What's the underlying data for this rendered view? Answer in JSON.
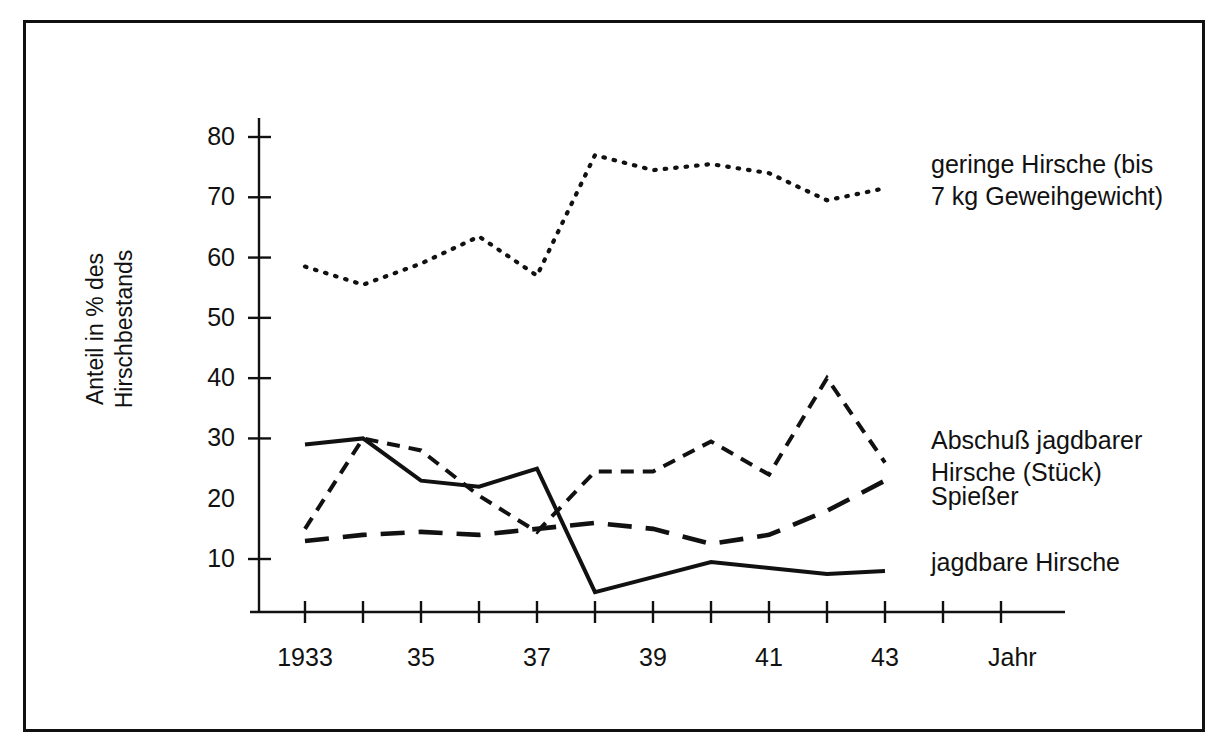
{
  "figure": {
    "background": "#ffffff",
    "ink_color": "#111111",
    "border_color": "#111111"
  },
  "axes": {
    "ylabel": "Anteil in % des\nHirschbestands",
    "xlabel": "Jahr",
    "ytick_labels": [
      "80",
      "70",
      "60",
      "50",
      "40",
      "30",
      "20",
      "10"
    ],
    "xtick_labels": [
      "1933",
      "35",
      "37",
      "39",
      "41",
      "43"
    ]
  },
  "legend": {
    "items": [
      {
        "name": "geringe-hirsche",
        "label": "geringe Hirsche (bis\n7 kg Geweihgewicht)",
        "style": "dotted"
      },
      {
        "name": "abschuss-jagdbarer-hirsche",
        "label": "Abschuß jagdbarer\nHirsche (Stück)",
        "style": "dashed-short"
      },
      {
        "name": "spiesser",
        "label": "Spießer",
        "style": "dashed-long"
      },
      {
        "name": "jagdbare-hirsche",
        "label": "jagdbare Hirsche",
        "style": "solid"
      }
    ]
  },
  "chart_data": {
    "type": "line",
    "title": "",
    "xlabel": "Jahr",
    "ylabel": "Anteil in % des Hirschbestands",
    "x": [
      1933,
      1934,
      1935,
      1936,
      1937,
      1938,
      1939,
      1940,
      1941,
      1942,
      1943
    ],
    "xtick_values": [
      1933,
      1934,
      1935,
      1936,
      1937,
      1938,
      1939,
      1940,
      1941,
      1942,
      1943,
      1944,
      1945
    ],
    "xtick_labeled": [
      1933,
      1935,
      1937,
      1939,
      1941,
      1943
    ],
    "ylim": [
      3,
      84
    ],
    "yticks": [
      10,
      20,
      30,
      40,
      50,
      60,
      70,
      80
    ],
    "grid": false,
    "legend_position": "right",
    "series": [
      {
        "name": "geringe Hirsche (bis 7 kg Geweihgewicht)",
        "style": "dotted",
        "values": [
          58.5,
          55.5,
          59.0,
          63.5,
          57.0,
          77.0,
          74.5,
          75.5,
          74.0,
          69.5,
          71.5
        ]
      },
      {
        "name": "Abschuß jagdbarer Hirsche (Stück)",
        "style": "dashed-short",
        "values": [
          15.0,
          30.0,
          28.0,
          20.5,
          14.5,
          24.5,
          24.5,
          29.5,
          24.0,
          40.0,
          26.0
        ]
      },
      {
        "name": "Spießer",
        "style": "dashed-long",
        "values": [
          13.0,
          14.0,
          14.5,
          14.0,
          15.0,
          16.0,
          15.0,
          12.5,
          14.0,
          18.0,
          23.0
        ]
      },
      {
        "name": "jagdbare Hirsche",
        "style": "solid",
        "values": [
          29.0,
          30.0,
          23.0,
          22.0,
          25.0,
          4.5,
          7.0,
          9.5,
          8.5,
          7.5,
          8.0
        ]
      }
    ]
  }
}
